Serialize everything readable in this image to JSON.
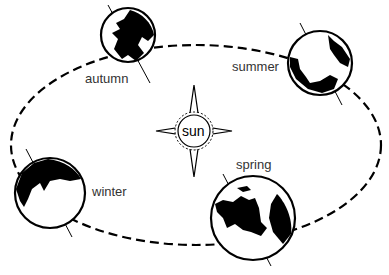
{
  "diagram": {
    "center": {
      "label": "sun"
    },
    "seasons": [
      {
        "name": "autumn",
        "label": "autumn"
      },
      {
        "name": "summer",
        "label": "summer"
      },
      {
        "name": "winter",
        "label": "winter"
      },
      {
        "name": "spring",
        "label": "spring"
      }
    ],
    "colors": {
      "ink": "#000000",
      "background": "#ffffff",
      "label": "#333333"
    }
  }
}
